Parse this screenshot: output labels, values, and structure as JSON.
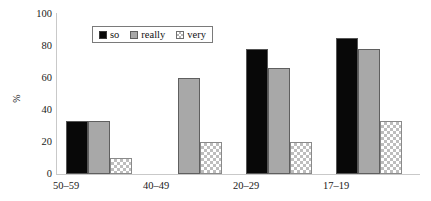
{
  "chart_data": {
    "type": "bar",
    "title": "",
    "subtitle": "",
    "xlabel": "",
    "ylabel": "%",
    "ylim": [
      0,
      100
    ],
    "yticks": [
      0,
      20,
      40,
      60,
      80,
      100
    ],
    "grid": false,
    "legend_position": "top-left-inside",
    "categories": [
      "50–59",
      "40–49",
      "20–29",
      "17–19"
    ],
    "series": [
      {
        "name": "so",
        "color": "#080808",
        "pattern": "solid-black",
        "values": [
          33,
          0,
          78,
          85
        ]
      },
      {
        "name": "really",
        "color": "#a8a8a8",
        "pattern": "solid-gray",
        "values": [
          33,
          60,
          66,
          78
        ]
      },
      {
        "name": "very",
        "color": "#ffffff",
        "pattern": "checkerboard",
        "values": [
          10,
          20,
          20,
          33
        ]
      }
    ]
  },
  "legend": {
    "items": [
      {
        "label": "so"
      },
      {
        "label": "really"
      },
      {
        "label": "very"
      }
    ]
  },
  "axes": {
    "y": {
      "ticks": [
        "100",
        "80",
        "60",
        "40",
        "20",
        "0"
      ],
      "label": "%"
    },
    "x": {
      "ticks": [
        "50–59",
        "40–49",
        "20–29",
        "17–19"
      ]
    }
  },
  "colors": {
    "series_so": "#080808",
    "series_really": "#a8a8a8",
    "series_very": "#ffffff",
    "axis": "#c9c9c9",
    "text": "#1a1a1a",
    "background": "#ffffff"
  }
}
